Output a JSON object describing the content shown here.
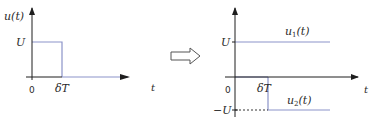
{
  "colors": {
    "axis": "#1e1e1e",
    "signal": "#8b93c9",
    "text": "#2b2b2b"
  },
  "left_graph": {
    "y_axis_label": "u(t)",
    "x_axis_label": "t",
    "origin_label": "0",
    "level_label": "U",
    "pulse_end_label": "δT"
  },
  "transform_arrow": {
    "icon": "hollow-right-arrow-icon"
  },
  "right_graph": {
    "x_axis_label": "t",
    "origin_label": "0",
    "pos_level_label": "U",
    "neg_level_label": "−U",
    "step_time_label": "δT",
    "series": [
      {
        "name": "u1",
        "label": "u₁(t)",
        "label_base": "u",
        "label_sub": "1",
        "label_tail": "(t)"
      },
      {
        "name": "u2",
        "label": "u₂(t)",
        "label_base": "u",
        "label_sub": "2",
        "label_tail": "(t)"
      }
    ]
  }
}
